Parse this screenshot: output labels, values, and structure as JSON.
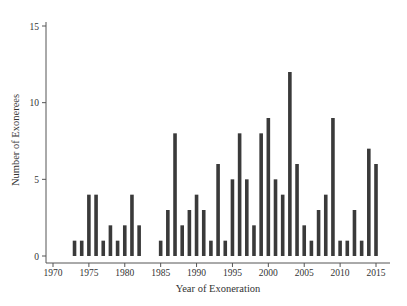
{
  "chart_data": {
    "type": "bar",
    "title": "",
    "xlabel": "Year of Exoneration",
    "ylabel": "Number of Exonerees",
    "xlim": [
      1969,
      2017
    ],
    "ylim": [
      0,
      15
    ],
    "xticks": [
      1970,
      1975,
      1980,
      1985,
      1990,
      1995,
      2000,
      2005,
      2010,
      2015
    ],
    "yticks": [
      0,
      5,
      10,
      15
    ],
    "grid": false,
    "legend": null,
    "bar_color": "#3a3a3a",
    "x": [
      1973,
      1974,
      1975,
      1976,
      1977,
      1978,
      1979,
      1980,
      1981,
      1982,
      1985,
      1986,
      1987,
      1988,
      1989,
      1990,
      1991,
      1992,
      1993,
      1994,
      1995,
      1996,
      1997,
      1998,
      1999,
      2000,
      2001,
      2002,
      2003,
      2004,
      2005,
      2006,
      2007,
      2008,
      2009,
      2010,
      2011,
      2012,
      2013,
      2014,
      2015
    ],
    "values": [
      1,
      1,
      4,
      4,
      1,
      2,
      1,
      2,
      4,
      2,
      1,
      3,
      8,
      2,
      3,
      4,
      3,
      1,
      6,
      1,
      5,
      8,
      5,
      2,
      8,
      9,
      5,
      4,
      12,
      6,
      2,
      1,
      3,
      4,
      9,
      1,
      1,
      3,
      1,
      7,
      6
    ]
  }
}
